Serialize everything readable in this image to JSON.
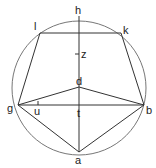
{
  "diagram": {
    "circle": {
      "cx": 79,
      "cy": 88,
      "r": 67,
      "color": "#666666"
    },
    "points": {
      "h": {
        "x": 79,
        "y": 16,
        "label": "h"
      },
      "l": {
        "x": 40,
        "y": 33,
        "label": "l"
      },
      "k": {
        "x": 121,
        "y": 33,
        "label": "k"
      },
      "z": {
        "x": 79,
        "y": 54,
        "label": "z"
      },
      "d": {
        "x": 79,
        "y": 87,
        "label": "d"
      },
      "g": {
        "x": 18,
        "y": 105,
        "label": "g"
      },
      "u": {
        "x": 38,
        "y": 105,
        "label": "u"
      },
      "t": {
        "x": 79,
        "y": 105,
        "label": "t"
      },
      "b": {
        "x": 144,
        "y": 105,
        "label": "b"
      },
      "a": {
        "x": 79,
        "y": 152,
        "label": "a"
      }
    },
    "segments": [
      [
        "h",
        "a"
      ],
      [
        "l",
        "k"
      ],
      [
        "l",
        "g"
      ],
      [
        "k",
        "b"
      ],
      [
        "g",
        "b"
      ],
      [
        "g",
        "d"
      ],
      [
        "d",
        "b"
      ],
      [
        "g",
        "a"
      ],
      [
        "b",
        "a"
      ]
    ],
    "line_color": "#333333"
  }
}
